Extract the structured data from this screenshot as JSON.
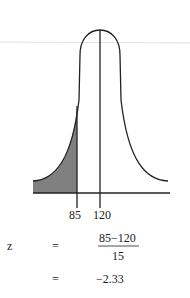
{
  "diagram": {
    "type": "normal-distribution-left-tail",
    "mean_label": "120",
    "cutoff_label": "85",
    "shading_color": "#808080",
    "line_color": "#222222"
  },
  "equation": {
    "variable": "z",
    "eq1": "=",
    "numerator": "85−120",
    "denominator": "15",
    "eq2": "=",
    "result": "−2.33"
  }
}
